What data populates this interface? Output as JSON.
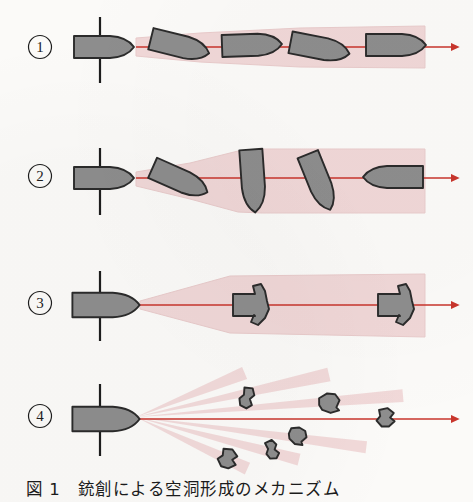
{
  "figure": {
    "caption_label": "図 1",
    "caption_text": "銃創による空洞形成のメカニズム",
    "caption_full": "図 1　銃創による空洞形成のメカニズム",
    "background_color": "#fbfaf8"
  },
  "colors": {
    "cavity_pink": "#f0d7d7",
    "cavity_pink_edge": "#e9cbcb",
    "bullet_gray": "#8d8d8d",
    "bullet_outline": "#2b2b2b",
    "track_red": "#c8352c",
    "skin_line": "#1d1d1d",
    "label_text": "#1d1d1d"
  },
  "rows": [
    {
      "id": "row-1",
      "label": "①",
      "label_x": 40,
      "label_y": 52,
      "mechanism": "straight-track-slight-yaw",
      "axis_y": 47,
      "skin_line": {
        "x": 100,
        "y1": 17,
        "y2": 83
      },
      "track_arrow": {
        "x1": 136,
        "x2": 462,
        "y": 47
      },
      "cavity": "narrow-gradually-widening",
      "cavity_points": "136,38 200,33 300,28 425,26 425,68 300,67 200,62 136,56",
      "bullets": [
        {
          "x": 104,
          "y": 47,
          "angle": 0,
          "scale": 1.0,
          "shape": "bullet"
        },
        {
          "x": 180,
          "y": 46,
          "angle": 14,
          "scale": 1.0,
          "shape": "bullet"
        },
        {
          "x": 252,
          "y": 45,
          "angle": -2,
          "scale": 1.0,
          "shape": "bullet"
        },
        {
          "x": 320,
          "y": 48,
          "angle": 11,
          "scale": 1.0,
          "shape": "bullet"
        },
        {
          "x": 396,
          "y": 45,
          "angle": 0,
          "scale": 1.0,
          "shape": "bullet"
        }
      ]
    },
    {
      "id": "row-2",
      "label": "②",
      "label_x": 40,
      "label_y": 181,
      "mechanism": "tumbling-yaw-large-cavity",
      "axis_y": 178,
      "skin_line": {
        "x": 100,
        "y1": 148,
        "y2": 215
      },
      "track_arrow": {
        "x1": 136,
        "x2": 462,
        "y": 178
      },
      "cavity": "wide-tumble-cavity",
      "cavity_points": "136,172 190,163 238,151 262,149 425,149 425,213 262,213 238,212 190,199 136,186",
      "bullets": [
        {
          "x": 104,
          "y": 178,
          "angle": 0,
          "scale": 1.0,
          "shape": "bullet"
        },
        {
          "x": 180,
          "y": 180,
          "angle": 24,
          "scale": 1.0,
          "shape": "bullet"
        },
        {
          "x": 253,
          "y": 181,
          "angle": 86,
          "scale": 1.05,
          "shape": "bullet"
        },
        {
          "x": 319,
          "y": 182,
          "angle": 68,
          "scale": 1.0,
          "shape": "bullet"
        },
        {
          "x": 393,
          "y": 177,
          "angle": 180,
          "scale": 1.0,
          "shape": "bullet"
        }
      ]
    },
    {
      "id": "row-3",
      "label": "③",
      "label_x": 40,
      "label_y": 308,
      "mechanism": "expanding-mushrooming-bullet",
      "axis_y": 305,
      "skin_line": {
        "x": 100,
        "y1": 271,
        "y2": 341
      },
      "track_arrow": {
        "x1": 140,
        "x2": 462,
        "y": 305
      },
      "cavity": "cone-widening-from-tip",
      "cavity_points": "140,301 230,276 425,274 425,337 230,333 140,309",
      "bullets": [
        {
          "x": 106,
          "y": 305,
          "angle": 0,
          "scale": 1.12,
          "shape": "bullet"
        },
        {
          "x": 255,
          "y": 305,
          "angle": 0,
          "scale": 1.0,
          "shape": "mushroom"
        },
        {
          "x": 400,
          "y": 305,
          "angle": 0,
          "scale": 1.0,
          "shape": "mushroom"
        }
      ]
    },
    {
      "id": "row-4",
      "label": "④",
      "label_x": 40,
      "label_y": 421,
      "mechanism": "fragmentation-multiple-tracks",
      "axis_y": 419,
      "skin_line": {
        "x": 100,
        "y1": 384,
        "y2": 456
      },
      "track_arrow": {
        "x1": 136,
        "x2": 462,
        "y": 419
      },
      "cavity": "fan-of-fragment-rays",
      "rays": [
        {
          "angle": -23,
          "length": 118,
          "width_end": 13
        },
        {
          "angle": -13,
          "length": 198,
          "width_end": 14
        },
        {
          "angle": -5,
          "length": 268,
          "width_end": 13
        },
        {
          "angle": 7,
          "length": 232,
          "width_end": 12
        },
        {
          "angle": 14,
          "length": 168,
          "width_end": 12
        },
        {
          "angle": 24,
          "length": 122,
          "width_end": 13
        }
      ],
      "bullets": [
        {
          "x": 106,
          "y": 419,
          "angle": 0,
          "scale": 1.12,
          "shape": "bullet"
        }
      ],
      "fragments": [
        {
          "x": 247,
          "y": 398,
          "angle": 20,
          "scale": 1.0,
          "shape": "fragment-a"
        },
        {
          "x": 330,
          "y": 403,
          "angle": -10,
          "scale": 1.1,
          "shape": "fragment-b"
        },
        {
          "x": 386,
          "y": 418,
          "angle": 8,
          "scale": 1.0,
          "shape": "fragment-c"
        },
        {
          "x": 298,
          "y": 436,
          "angle": 15,
          "scale": 0.95,
          "shape": "fragment-b"
        },
        {
          "x": 272,
          "y": 450,
          "angle": -12,
          "scale": 0.9,
          "shape": "fragment-a"
        },
        {
          "x": 228,
          "y": 459,
          "angle": 25,
          "scale": 1.05,
          "shape": "fragment-c"
        }
      ]
    }
  ]
}
